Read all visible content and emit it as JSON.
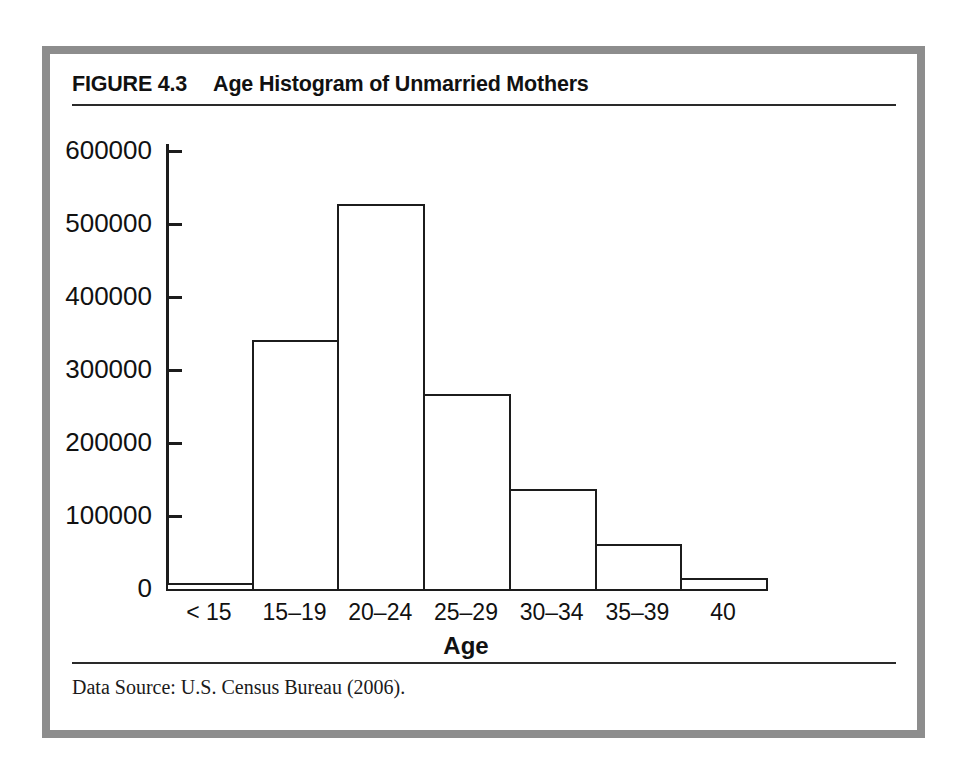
{
  "figure": {
    "label": "FIGURE 4.3",
    "title": "Age Histogram of Unmarried Mothers",
    "source": "Data Source: U.S. Census Bureau (2006)."
  },
  "colors": {
    "frame": "#8d8d8d",
    "ink": "#1c1c1c",
    "page": "#ffffff"
  },
  "chart_data": {
    "type": "bar",
    "title": "Age Histogram of Unmarried Mothers",
    "xlabel": "Age",
    "ylabel": "",
    "categories": [
      "< 15",
      "15–19",
      "20–24",
      "25–29",
      "30–34",
      "35–39",
      "40"
    ],
    "values": [
      8000,
      341000,
      527000,
      267000,
      137000,
      62000,
      15000
    ],
    "ylim": [
      0,
      600000
    ],
    "yticks": [
      0,
      100000,
      200000,
      300000,
      400000,
      500000,
      600000
    ],
    "ytick_labels": [
      "0",
      "100000",
      "200000",
      "300000",
      "400000",
      "500000",
      "600000"
    ],
    "grid": false,
    "legend": false
  }
}
